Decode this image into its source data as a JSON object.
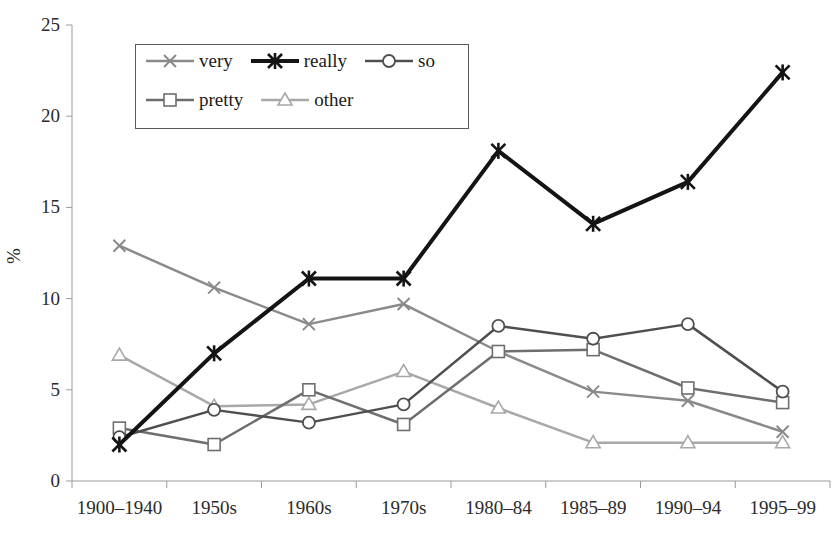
{
  "chart_data": {
    "type": "line",
    "title": "",
    "xlabel": "",
    "ylabel": "%",
    "categories": [
      "1900–1940",
      "1950s",
      "1960s",
      "1970s",
      "1980–84",
      "1985–89",
      "1990–94",
      "1995–99"
    ],
    "ylim": [
      0,
      25
    ],
    "yticks": [
      0,
      5,
      10,
      15,
      20,
      25
    ],
    "grid": false,
    "legend_position": "upper-left-inside",
    "series": [
      {
        "name": "very",
        "marker": "x-cross",
        "color": "#8a8a8a",
        "width": 2.5,
        "values": [
          12.9,
          10.6,
          8.6,
          9.7,
          7.1,
          4.9,
          4.4,
          2.7
        ]
      },
      {
        "name": "really",
        "marker": "asterisk",
        "color": "#141414",
        "width": 4.0,
        "values": [
          2.0,
          7.0,
          11.1,
          11.1,
          18.1,
          14.1,
          16.4,
          22.4
        ]
      },
      {
        "name": "so",
        "marker": "circle",
        "color": "#4f4f4f",
        "width": 2.5,
        "values": [
          2.4,
          3.9,
          3.2,
          4.2,
          8.5,
          7.8,
          8.6,
          4.9
        ]
      },
      {
        "name": "pretty",
        "marker": "square",
        "color": "#6e6e6e",
        "width": 2.5,
        "values": [
          2.9,
          2.0,
          5.0,
          3.1,
          7.1,
          7.2,
          5.1,
          4.3
        ]
      },
      {
        "name": "other",
        "marker": "triangle",
        "color": "#a8a8a8",
        "width": 2.5,
        "values": [
          6.9,
          4.1,
          4.2,
          6.0,
          4.0,
          2.1,
          2.1,
          2.1
        ]
      }
    ]
  },
  "axes": {
    "y_tick_labels": [
      "0",
      "5",
      "10",
      "15",
      "20",
      "25"
    ],
    "y_axis_title": "%",
    "x_tick_labels": [
      "1900–1940",
      "1950s",
      "1960s",
      "1970s",
      "1980–84",
      "1985–89",
      "1990–94",
      "1995–99"
    ]
  },
  "legend": {
    "row1": [
      "very",
      "really",
      "so"
    ],
    "row2": [
      "pretty",
      "other"
    ]
  }
}
